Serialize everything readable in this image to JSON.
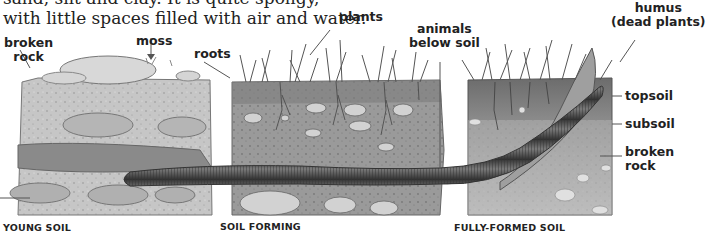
{
  "intro": {
    "line1": "sand, silt and clay. It is quite spongy,",
    "line2": "with little spaces filled with air and water."
  },
  "labels": {
    "broken_rock_left": [
      "broken",
      "rock"
    ],
    "moss": "moss",
    "roots": "roots",
    "plants": "plants",
    "animals": [
      "animals",
      "below soil"
    ],
    "humus": [
      "humus",
      "(dead plants)"
    ],
    "topsoil": "topsoil",
    "subsoil": "subsoil",
    "broken_rock_right": [
      "broken",
      "rock"
    ]
  },
  "captions": {
    "young": "YOUNG SOIL",
    "forming": "SOIL FORMING",
    "formed": "FULLY-FORMED SOIL"
  },
  "colors": {
    "soil_light": "#c9c9c9",
    "soil_mid": "#a3a3a3",
    "soil_dark": "#6f6f6f",
    "worm": "#5a5a5a",
    "text": "#222222"
  }
}
